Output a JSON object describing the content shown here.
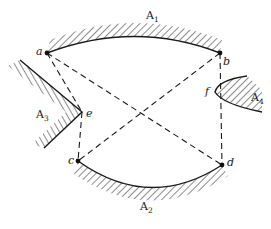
{
  "diagram": {
    "type": "visibility-graph",
    "regions": [
      {
        "id": "A1",
        "label": "A",
        "subscript": "1",
        "label_pos": [
          146,
          19
        ]
      },
      {
        "id": "A2",
        "label": "A",
        "subscript": "2",
        "label_pos": [
          140,
          210
        ]
      },
      {
        "id": "A3",
        "label": "A",
        "subscript": "3",
        "label_pos": [
          36,
          118
        ]
      },
      {
        "id": "A4",
        "label": "A",
        "subscript": "4",
        "label_pos": [
          251,
          101
        ]
      }
    ],
    "points": [
      {
        "id": "a",
        "label": "a",
        "x": 47,
        "y": 53,
        "dot": true
      },
      {
        "id": "b",
        "label": "b",
        "x": 220,
        "y": 53,
        "dot": true
      },
      {
        "id": "c",
        "label": "c",
        "x": 78,
        "y": 161,
        "dot": true
      },
      {
        "id": "d",
        "label": "d",
        "x": 222,
        "y": 165,
        "dot": true
      },
      {
        "id": "e",
        "label": "e",
        "x": 82,
        "y": 112,
        "dot": false
      },
      {
        "id": "f",
        "label": "f",
        "x": 215,
        "y": 90,
        "dot": false
      }
    ],
    "edges": [
      {
        "from": "a",
        "to": "b"
      },
      {
        "from": "a",
        "to": "e"
      },
      {
        "from": "a",
        "to": "d"
      },
      {
        "from": "b",
        "to": "c"
      },
      {
        "from": "b",
        "to": "d"
      },
      {
        "from": "e",
        "to": "c"
      },
      {
        "from": "c",
        "to": "d"
      }
    ],
    "colors": {
      "ink": "#1a1a1a",
      "background": "#ffffff"
    }
  }
}
